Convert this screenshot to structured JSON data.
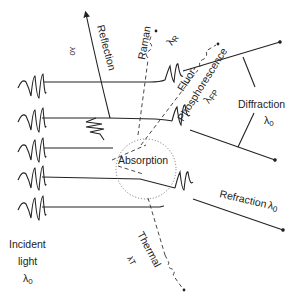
{
  "diagram": {
    "type": "light-matter interaction schematic",
    "labels": {
      "incident_line1": "Incident",
      "incident_line2": "light",
      "incident_lambda": "λ",
      "incident_sub": "0",
      "reflection": "Reflection",
      "reflection_lambda": "λ0",
      "raman": "Raman",
      "raman_lambda": "λ",
      "raman_sub": "R",
      "fluor": "Fluor-",
      "phosphorescence": "Phosphorescence",
      "fp_lambda": "λ",
      "fp_sub": "FP",
      "diffraction": "Diffraction",
      "diffraction_lambda": "λ",
      "diffraction_sub": "0",
      "absorption": "Absorption",
      "refraction": "Refraction",
      "refraction_lambda": "λ",
      "refraction_sub": "0",
      "thermal": "Thermal",
      "thermal_lambda": "λ",
      "thermal_sub": "T"
    },
    "incident_beams": 5,
    "colors": {
      "line": "#222222",
      "dotted_circle": "#666666",
      "background": "#ffffff"
    }
  }
}
